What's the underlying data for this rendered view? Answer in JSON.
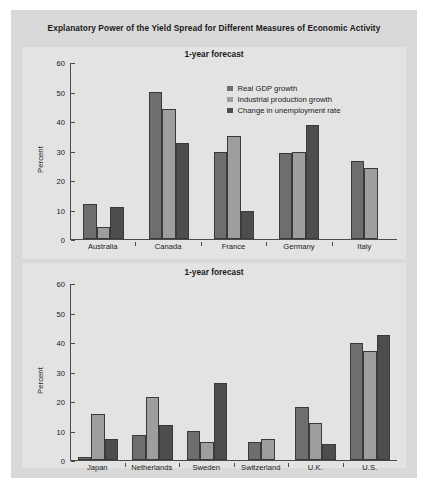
{
  "figure": {
    "title": "Explanatory Power of the Yield Spread for Different Measures of Economic Activity"
  },
  "chart_data": [
    {
      "type": "bar",
      "title": "1-year forecast",
      "xlabel": "",
      "ylabel": "Percent",
      "ylim": [
        0,
        60
      ],
      "yticks": [
        0,
        10,
        20,
        30,
        40,
        50,
        60
      ],
      "grid": false,
      "legend_position": "upper center",
      "categories": [
        "Australia",
        "Canada",
        "France",
        "Germany",
        "Italy"
      ],
      "series": [
        {
          "name": "Real GDP growth",
          "color": "#6e6e6e",
          "values": [
            12,
            50,
            29.5,
            29,
            26.5
          ]
        },
        {
          "name": "Industrial production growth",
          "color": "#9e9e9e",
          "values": [
            4,
            44,
            35,
            29.5,
            24
          ]
        },
        {
          "name": "Change in unemployment rate",
          "color": "#4d4d4d",
          "values": [
            11,
            32.5,
            9.5,
            38.5,
            null
          ]
        }
      ]
    },
    {
      "type": "bar",
      "title": "1-year forecast",
      "xlabel": "",
      "ylabel": "Percent",
      "ylim": [
        0,
        60
      ],
      "yticks": [
        0,
        10,
        20,
        30,
        40,
        50,
        60
      ],
      "grid": false,
      "legend_position": "none",
      "categories": [
        "Japan",
        "Netherlands",
        "Sweden",
        "Switzerland",
        "U.K.",
        "U.S."
      ],
      "series": [
        {
          "name": "Real GDP growth",
          "color": "#6e6e6e",
          "values": [
            1,
            8.5,
            10,
            6,
            18,
            39.5
          ]
        },
        {
          "name": "Industrial production growth",
          "color": "#9e9e9e",
          "values": [
            15.5,
            21.5,
            6,
            7,
            12.5,
            37
          ]
        },
        {
          "name": "Change in unemployment rate",
          "color": "#4d4d4d",
          "values": [
            7,
            12,
            26,
            null,
            5.5,
            42.5
          ]
        }
      ]
    }
  ]
}
